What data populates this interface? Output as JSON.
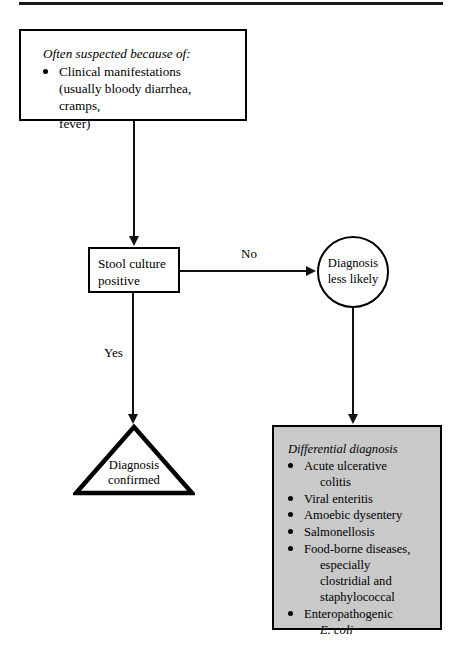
{
  "document": {
    "title": "Diagnostic flowchart for infectious diarrhea",
    "top_rule": true
  },
  "nodes": {
    "suspect_box": {
      "kind": "process-box",
      "heading": "Often suspected because of:",
      "items": [
        {
          "text": "Clinical manifestations",
          "continuation": [
            "(usually bloody diarrhea, cramps,",
            "fever)"
          ]
        }
      ]
    },
    "stool_box": {
      "kind": "decision-box",
      "lines": [
        "Stool culture",
        "positive"
      ]
    },
    "circle_node": {
      "kind": "circle",
      "lines": [
        "Diagnosis",
        "less likely"
      ]
    },
    "triangle_node": {
      "kind": "triangle",
      "lines": [
        "Diagnosis",
        "confirmed"
      ]
    },
    "ddx_box": {
      "kind": "shaded-box",
      "fill": "#c9c9c9",
      "heading": "Differential diagnosis",
      "items": [
        {
          "text": "Acute ulcerative",
          "continuation": [
            "colitis"
          ]
        },
        {
          "text": "Viral enteritis",
          "continuation": []
        },
        {
          "text": "Amoebic dysentery",
          "continuation": []
        },
        {
          "text": "Salmonellosis",
          "continuation": []
        },
        {
          "text": "Food-borne diseases,",
          "continuation": [
            "especially",
            "clostridial and",
            "staphylococcal"
          ]
        },
        {
          "text": "Enteropathogenic",
          "continuation": [
            "E. coli"
          ],
          "continuation_italic": true
        }
      ]
    }
  },
  "edges": {
    "suspect_to_stool": {
      "label": ""
    },
    "stool_to_circle": {
      "label": "No"
    },
    "stool_to_triangle": {
      "label": "Yes"
    },
    "circle_to_ddx": {
      "label": ""
    }
  },
  "colors": {
    "ink": "#000000",
    "shade": "#c9c9c9",
    "page": "#ffffff"
  }
}
